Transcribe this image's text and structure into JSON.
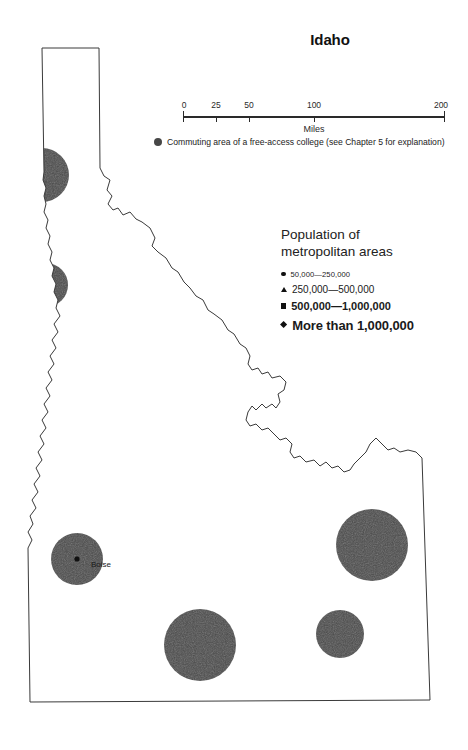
{
  "map": {
    "title": "Idaho",
    "state": "Idaho",
    "projection_note": "outline map of the state of Idaho"
  },
  "scalebar": {
    "units": "Miles",
    "ticks": [
      {
        "label": "0",
        "value": 0
      },
      {
        "label": "25",
        "value": 25
      },
      {
        "label": "50",
        "value": 50
      },
      {
        "label": "100",
        "value": 100
      },
      {
        "label": "200",
        "value": 200
      }
    ],
    "max": 200
  },
  "commuting": {
    "swatch_icon": "filled-circle-icon",
    "text": "Commuting area of a free-access college (see Chapter 5 for explanation)",
    "color": "#474747"
  },
  "population_legend": {
    "title_line_1": "Population of",
    "title_line_2": "metropolitan areas",
    "entries": [
      {
        "marker": "circle-icon",
        "label": "50,000—250,000"
      },
      {
        "marker": "triangle-icon",
        "label": "250,000—500,000"
      },
      {
        "marker": "square-icon",
        "label": "500,000—1,000,000"
      },
      {
        "marker": "diamond-icon",
        "label": "More than 1,000,000"
      }
    ]
  },
  "cities": [
    {
      "name": "Boise",
      "marker": "circle-icon",
      "x": 77,
      "y": 559
    }
  ],
  "commuting_areas": [
    {
      "id": "coeur-dalene",
      "cx": 42,
      "cy": 175,
      "r": 27
    },
    {
      "id": "lewiston",
      "cx": 46,
      "cy": 285,
      "r": 22
    },
    {
      "id": "boise",
      "cx": 77,
      "cy": 559,
      "r": 26
    },
    {
      "id": "idaho-falls",
      "cx": 372,
      "cy": 545,
      "r": 36
    },
    {
      "id": "twin-falls",
      "cx": 200,
      "cy": 645,
      "r": 36
    },
    {
      "id": "pocatello",
      "cx": 340,
      "cy": 634,
      "r": 24
    }
  ],
  "colors": {
    "commuting_fill": "#4a4a4a",
    "outline": "#3a3a3a",
    "text": "#1a1a1a",
    "background": "#ffffff"
  }
}
